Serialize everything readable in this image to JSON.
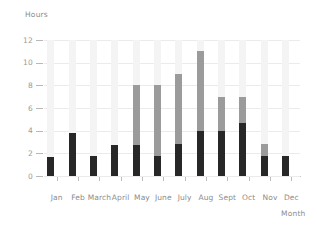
{
  "chart_data": {
    "type": "bar",
    "title": "",
    "subtitle": "",
    "xlabel": "Month",
    "ylabel": "Hours",
    "ylim": [
      0,
      12
    ],
    "yticks": [
      0,
      2,
      4,
      6,
      8,
      10,
      12
    ],
    "ytick_labels": [
      "0",
      "2",
      "4",
      "6",
      "8",
      "10",
      "12"
    ],
    "grid": true,
    "legend": "none",
    "stacked": true,
    "categories": [
      "Jan",
      "Feb",
      "March",
      "April",
      "May",
      "June",
      "July",
      "Aug",
      "Sept",
      "Oct",
      "Nov",
      "Dec"
    ],
    "series": [
      {
        "name": "base",
        "color": "#272727",
        "values": [
          1.7,
          3.8,
          1.8,
          2.7,
          2.7,
          1.8,
          2.8,
          4.0,
          4.0,
          4.7,
          1.8,
          1.8
        ]
      },
      {
        "name": "mid",
        "color": "#9b9b9b",
        "cumulative_tops": [
          1.7,
          3.8,
          1.8,
          2.7,
          8.0,
          8.0,
          9.0,
          11.0,
          7.0,
          7.0,
          2.8,
          1.8
        ],
        "values": [
          0,
          0,
          0,
          0,
          5.3,
          6.2,
          6.2,
          7.0,
          3.0,
          2.3,
          1.0,
          0
        ]
      },
      {
        "name": "target",
        "color": "#f5f4f4",
        "cumulative_tops": [
          12,
          12,
          12,
          12,
          12,
          12,
          12,
          12,
          12,
          12,
          12,
          12
        ],
        "values": [
          10.3,
          8.2,
          10.2,
          9.3,
          4.0,
          4.0,
          3.0,
          1.0,
          5.0,
          5.0,
          9.2,
          10.2
        ]
      }
    ]
  },
  "axes": {
    "y_title": "Hours",
    "x_title": "Month"
  }
}
